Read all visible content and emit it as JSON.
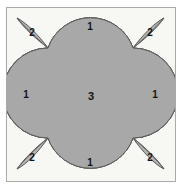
{
  "figure": {
    "background_color": "#f7f7f3",
    "frame_color": "#a9a9a9",
    "page_color": "#ffffff",
    "outline_color": "#595959",
    "region_colors": {
      "crescent": "#787878",
      "petal": "#b4b4b4",
      "center": "#a8a8a8",
      "lens_white": "#fbfbf9"
    },
    "geometry": {
      "node_top_left": [
        48,
        48
      ],
      "node_top_right": [
        133,
        48
      ],
      "node_bottom_left": [
        48,
        138
      ],
      "node_bottom_right": [
        133,
        138
      ],
      "circle_radius": 45,
      "circle_centers": [
        [
          90.5,
          48
        ],
        [
          90.5,
          138
        ],
        [
          48,
          93
        ],
        [
          133,
          93
        ]
      ]
    },
    "regions": [
      {
        "name": "crescent-top",
        "label": "1",
        "x": 90,
        "y": 27,
        "kind": "crescent"
      },
      {
        "name": "crescent-right",
        "label": "1",
        "x": 155,
        "y": 95,
        "kind": "crescent"
      },
      {
        "name": "crescent-bottom",
        "label": "1",
        "x": 90,
        "y": 163,
        "kind": "crescent"
      },
      {
        "name": "crescent-left",
        "label": "1",
        "x": 26,
        "y": 95,
        "kind": "crescent"
      },
      {
        "name": "petal-top-left",
        "label": "2",
        "x": 32,
        "y": 33,
        "kind": "petal"
      },
      {
        "name": "petal-top-right",
        "label": "2",
        "x": 150,
        "y": 33,
        "kind": "petal"
      },
      {
        "name": "petal-bottom-left",
        "label": "2",
        "x": 32,
        "y": 158,
        "kind": "petal"
      },
      {
        "name": "petal-bottom-right",
        "label": "2",
        "x": 150,
        "y": 158,
        "kind": "petal"
      },
      {
        "name": "center-astroid",
        "label": "3",
        "x": 91,
        "y": 97,
        "kind": "center"
      }
    ]
  }
}
